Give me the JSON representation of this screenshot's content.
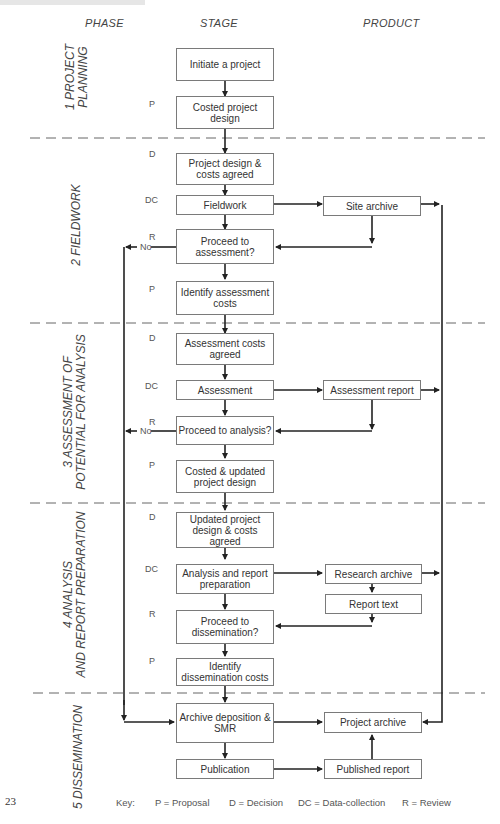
{
  "diagram": {
    "columns": {
      "phase": "PHASE",
      "stage": "STAGE",
      "product": "PRODUCT"
    },
    "phases": [
      {
        "id": 1,
        "label_line1": "1   PROJECT",
        "label_line2": "PLANNING"
      },
      {
        "id": 2,
        "label_line1": "2      FIELDWORK",
        "label_line2": ""
      },
      {
        "id": 3,
        "label_line1": "3    ASSESSMENT OF",
        "label_line2": "POTENTIAL FOR ANALYSIS"
      },
      {
        "id": 4,
        "label_line1": "4     ANALYSIS",
        "label_line2": "AND REPORT PREPARATION"
      },
      {
        "id": 5,
        "label_line1": "5 DISSEMINATION",
        "label_line2": ""
      }
    ],
    "stages": [
      {
        "code": "",
        "text": "Initiate a project"
      },
      {
        "code": "P",
        "text": "Costed project design"
      },
      {
        "code": "D",
        "text": "Project design & costs agreed"
      },
      {
        "code": "DC",
        "text": "Fieldwork"
      },
      {
        "code": "R",
        "text": "Proceed to assessment?"
      },
      {
        "code": "P",
        "text": "Identify assessment costs"
      },
      {
        "code": "D",
        "text": "Assessment  costs agreed"
      },
      {
        "code": "DC",
        "text": "Assessment"
      },
      {
        "code": "R",
        "text": "Proceed to analysis?"
      },
      {
        "code": "P",
        "text": "Costed & updated project design"
      },
      {
        "code": "D",
        "text": "Updated project design & costs agreed"
      },
      {
        "code": "DC",
        "text": "Analysis and report preparation"
      },
      {
        "code": "R",
        "text": "Proceed to dissemination?"
      },
      {
        "code": "P",
        "text": "Identify dissemination costs"
      },
      {
        "code": "",
        "text": "Archive deposition & SMR"
      },
      {
        "code": "",
        "text": "Publication"
      }
    ],
    "products": [
      {
        "text": "Site archive"
      },
      {
        "text": "Assessment report"
      },
      {
        "text": "Research archive"
      },
      {
        "text": "Report text"
      },
      {
        "text": "Project archive"
      },
      {
        "text": "Published report"
      }
    ],
    "no_label": "No",
    "page_number": "23",
    "key": {
      "label": "Key:",
      "items": [
        "P = Proposal",
        "D = Decision",
        "DC = Data-collection",
        "R = Review"
      ]
    }
  }
}
